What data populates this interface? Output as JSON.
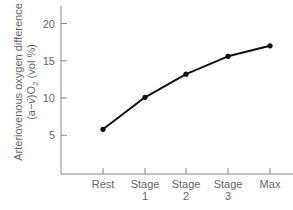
{
  "chart_data": {
    "type": "line",
    "title": "",
    "xlabel": "",
    "ylabel": "Arteriovenous oxygen difference (a−v̄)O₂ (vol %)",
    "ylabel_lines": [
      "Arteriovenous oxygen difference",
      "(a−v̄)O₂ (vol %)"
    ],
    "categories": [
      "Rest",
      "Stage 1",
      "Stage 2",
      "Stage 3",
      "Max"
    ],
    "category_lines": [
      [
        "Rest"
      ],
      [
        "Stage",
        "1"
      ],
      [
        "Stage",
        "2"
      ],
      [
        "Stage",
        "3"
      ],
      [
        "Max"
      ]
    ],
    "values": [
      5.8,
      10.1,
      13.2,
      15.6,
      17.0
    ],
    "yticks": [
      5,
      10,
      15,
      20
    ],
    "ylim": [
      0,
      22
    ],
    "grid": false,
    "legend": null,
    "markers": true,
    "colors": {
      "line": "#111111",
      "axis": "#888888",
      "text": "#666666"
    }
  }
}
